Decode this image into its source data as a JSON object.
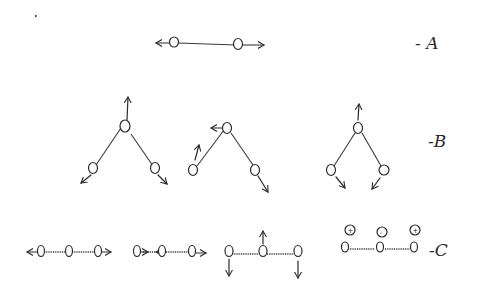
{
  "diagram": {
    "labels": {
      "A": "- A",
      "B": "-B",
      "C": "-C"
    },
    "rows": [
      {
        "id": "A",
        "description": "Linear diatomic stretching: two atoms on a bond moving apart",
        "modes": [
          {
            "atoms": 2,
            "motion": "stretch, arrows outward along axis"
          }
        ]
      },
      {
        "id": "B",
        "description": "Bent triatomic normal modes",
        "modes": [
          {
            "name": "symmetric stretch",
            "motion": "central atom up, outer atoms outward-down"
          },
          {
            "name": "asymmetric stretch",
            "motion": "central atom left, left atom up, right atom down-right"
          },
          {
            "name": "bending",
            "motion": "central atom up, outer atoms inward-down"
          }
        ]
      },
      {
        "id": "C",
        "description": "Linear triatomic normal modes",
        "modes": [
          {
            "name": "symmetric stretch",
            "motion": "outer atoms outward"
          },
          {
            "name": "asymmetric stretch",
            "motion": "atoms move same direction, central opposite"
          },
          {
            "name": "bending (in-plane)",
            "motion": "outer atoms down, central atom up"
          },
          {
            "name": "bending (out-of-plane)",
            "motion": "signs +, -, + above atoms"
          }
        ]
      }
    ],
    "out_of_plane_signs": [
      "+",
      "-",
      "+"
    ]
  }
}
